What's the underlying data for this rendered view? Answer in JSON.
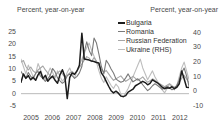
{
  "chart_data": {
    "type": "line",
    "title": "",
    "ylabel": "Percent, year-on-year",
    "ylabel_right": "Percent, year-on-year",
    "xlabel": "",
    "grid": false,
    "legend_position": "top-right",
    "ylim": [
      -5,
      27
    ],
    "ylim_right": [
      -10,
      44
    ],
    "yticks": [
      "25",
      "20",
      "15",
      "10",
      "5",
      "0",
      "-5"
    ],
    "ytick_values": [
      25,
      20,
      15,
      10,
      5,
      0,
      -5
    ],
    "yticks_right": [
      "40",
      "30",
      "20",
      "10",
      "0",
      "-10"
    ],
    "ytick_values_right": [
      40,
      30,
      20,
      10,
      0,
      -10
    ],
    "xticks": [
      "2005",
      "2006",
      "2007",
      "2008",
      "2009",
      "2010",
      "2011",
      "2012"
    ],
    "xtick_values": [
      2005,
      2006,
      2007,
      2008,
      2009,
      2010,
      2011,
      2012
    ],
    "x_start": 2005.0,
    "x_end": 2012.9,
    "series": [
      {
        "name": "Bulgaria",
        "axis": "left",
        "color": "#1c1c1c",
        "width": 1.5,
        "values": [
          4.6,
          8.0,
          6.2,
          7.3,
          5.6,
          6.6,
          5.4,
          7.6,
          9.0,
          6.1,
          7.4,
          5.0,
          6.2,
          7.1,
          5.4,
          4.2,
          7.6,
          9.7,
          7.0,
          -2.0,
          6.5,
          8.4,
          7.8,
          9.2,
          11.5,
          24.5,
          14.0,
          13.8,
          13.6,
          13.2,
          13.0,
          12.6,
          12.4,
          8.4,
          7.0,
          5.0,
          3.0,
          1.2,
          0.3,
          1.0,
          0.2,
          -1.0,
          -1.2,
          -0.8,
          0.6,
          1.2,
          1.8,
          3.2,
          3.8,
          4.4,
          5.0,
          4.5,
          3.6,
          4.2,
          5.6,
          5.0,
          4.4,
          3.6,
          2.6,
          2.0,
          2.4,
          2.2,
          2.8,
          2.0,
          2.6,
          4.0,
          9.2,
          6.0,
          2.6,
          2.5
        ]
      },
      {
        "name": "Romania",
        "axis": "left",
        "color": "#7a7a7a",
        "width": 1.1,
        "values": [
          9.0,
          7.4,
          6.3,
          8.6,
          7.0,
          6.0,
          8.2,
          9.0,
          7.1,
          6.2,
          5.0,
          6.0,
          7.4,
          10.2,
          8.8,
          6.4,
          5.2,
          4.2,
          5.0,
          7.2,
          8.0,
          7.3,
          6.2,
          7.0,
          8.4,
          11.0,
          17.0,
          21.0,
          17.5,
          15.4,
          22.5,
          20.5,
          16.0,
          11.0,
          8.0,
          13.5,
          12.0,
          10.0,
          8.4,
          6.0,
          5.2,
          4.6,
          5.0,
          6.4,
          8.0,
          6.2,
          4.8,
          5.4,
          6.0,
          5.0,
          3.6,
          2.4,
          1.2,
          2.0,
          3.2,
          4.0,
          3.4,
          2.6,
          1.8,
          2.2,
          3.0,
          2.4,
          1.6,
          2.0,
          3.4,
          5.4,
          8.6,
          10.4,
          7.2,
          3.0
        ]
      },
      {
        "name": "Russian Federation",
        "axis": "left",
        "color": "#a6a6a6",
        "width": 1.1,
        "values": [
          12.8,
          13.4,
          11.0,
          9.6,
          10.8,
          9.2,
          8.4,
          9.6,
          10.4,
          11.2,
          9.6,
          8.4,
          7.2,
          6.4,
          7.0,
          8.4,
          9.2,
          8.0,
          6.6,
          7.4,
          8.4,
          9.0,
          8.0,
          9.2,
          10.6,
          12.0,
          13.6,
          15.0,
          14.4,
          13.0,
          14.6,
          13.2,
          11.4,
          10.0,
          8.6,
          9.4,
          8.0,
          6.6,
          5.4,
          6.0,
          6.6,
          7.2,
          6.0,
          5.0,
          5.6,
          6.4,
          7.0,
          6.2,
          5.4,
          6.0,
          6.8,
          5.6,
          4.6,
          5.2,
          6.0,
          5.4,
          4.6,
          4.0,
          3.4,
          2.8,
          3.4,
          4.0,
          3.2,
          2.6,
          3.2,
          4.6,
          6.2,
          7.4,
          6.0,
          4.4
        ]
      },
      {
        "name": "Ukraine (RHS)",
        "axis": "right",
        "color": "#bdbdbd",
        "width": 1.1,
        "values": [
          22.0,
          17.0,
          12.0,
          18.0,
          14.0,
          10.0,
          12.0,
          19.0,
          15.0,
          10.0,
          8.0,
          12.0,
          16.0,
          13.0,
          9.0,
          14.0,
          10.0,
          7.0,
          9.0,
          13.0,
          16.0,
          12.0,
          9.0,
          14.0,
          18.0,
          22.0,
          26.0,
          30.0,
          33.0,
          28.0,
          24.0,
          20.0,
          14.0,
          9.0,
          6.0,
          10.0,
          7.0,
          4.0,
          2.0,
          5.0,
          3.0,
          -2.0,
          -4.0,
          -1.0,
          2.0,
          6.0,
          10.0,
          14.0,
          18.0,
          22.0,
          16.0,
          12.0,
          8.0,
          11.0,
          14.0,
          10.0,
          7.0,
          4.0,
          1.0,
          -1.0,
          2.0,
          5.0,
          3.0,
          1.0,
          4.0,
          10.0,
          16.0,
          20.0,
          14.0,
          8.0
        ]
      }
    ]
  }
}
